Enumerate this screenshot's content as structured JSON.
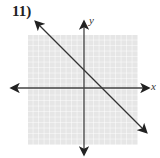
{
  "problem_number": "11)",
  "axes": {
    "x_label": "x",
    "y_label": "y"
  },
  "grid": {
    "cells": 20,
    "color": "#cfcfcf",
    "background": "#e8e8e8"
  },
  "line": {
    "description": "decreasing line, y-intercept approx 3, x-intercept approx 3",
    "slope": -1,
    "y_intercept": 3
  }
}
